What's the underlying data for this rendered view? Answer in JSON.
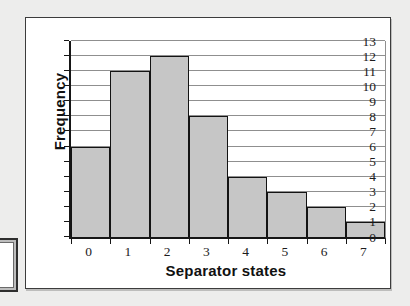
{
  "chart_data": {
    "type": "bar",
    "subtype": "histogram",
    "title": "",
    "xlabel": "Separator states",
    "ylabel": "Frequency",
    "categories": [
      "0",
      "1",
      "2",
      "3",
      "4",
      "5",
      "6",
      "7"
    ],
    "values": [
      6,
      11,
      12,
      8,
      4,
      3,
      2,
      1
    ],
    "ylim": [
      0,
      13
    ],
    "yticks": [
      0,
      1,
      2,
      3,
      4,
      5,
      6,
      7,
      8,
      9,
      10,
      11,
      12,
      13
    ],
    "grid": "horizontal",
    "legend": "none",
    "bars_touching": true
  },
  "colors": {
    "page_bg": "#ededec",
    "chart_bg": "#ffffff",
    "bar_fill": "#c6c6c6",
    "bar_border": "#131313",
    "gridline": "#8f8f8f",
    "axis": "#161616",
    "frame_border": "#3c3c3c"
  }
}
